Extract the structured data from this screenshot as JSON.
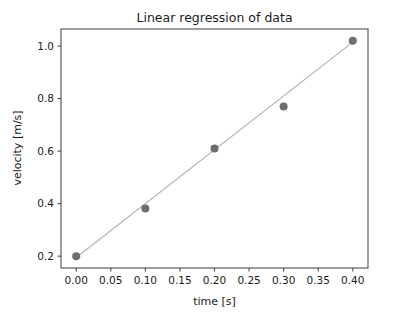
{
  "chart_data": {
    "type": "scatter",
    "title": "Linear regression of data",
    "xlabel": "time [s]",
    "ylabel": "velocity [m/s]",
    "xlim": [
      -0.022,
      0.422
    ],
    "ylim": [
      0.155,
      1.065
    ],
    "grid": false,
    "legend": null,
    "xticks": [
      0.0,
      0.05,
      0.1,
      0.15,
      0.2,
      0.25,
      0.3,
      0.35,
      0.4
    ],
    "xticklabels": [
      "0.00",
      "0.05",
      "0.10",
      "0.15",
      "0.20",
      "0.25",
      "0.30",
      "0.35",
      "0.40"
    ],
    "yticks": [
      0.2,
      0.4,
      0.6,
      0.8,
      1.0
    ],
    "yticklabels": [
      "0.2",
      "0.4",
      "0.6",
      "0.8",
      "1.0"
    ],
    "series": [
      {
        "name": "data",
        "type": "scatter",
        "marker": "o",
        "color": "#6e6e6e",
        "x": [
          0.0,
          0.1,
          0.2,
          0.3,
          0.4
        ],
        "y": [
          0.2,
          0.382,
          0.61,
          0.77,
          1.02
        ]
      },
      {
        "name": "linear fit",
        "type": "line",
        "color": "#b3b3b3",
        "x": [
          0.0,
          0.4
        ],
        "y": [
          0.195,
          1.015
        ]
      }
    ],
    "colors": {
      "marker": "#6e6e6e",
      "line": "#b3b3b3",
      "spine": "#4d4d4d",
      "text": "#1a1a1a",
      "background": "#ffffff"
    }
  }
}
